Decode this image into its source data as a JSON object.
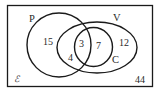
{
  "diagram": {
    "type": "venn",
    "universal_set": {
      "symbol": "ℰ",
      "outside_count": "44"
    },
    "sets": [
      {
        "name": "P",
        "label": "P"
      },
      {
        "name": "V",
        "label": "V"
      },
      {
        "name": "C",
        "label": "C"
      }
    ],
    "regions": {
      "p_only": "15",
      "p_and_v_not_c": "4",
      "p_and_v_and_c": "3",
      "v_and_c_not_p": "7",
      "v_only": "12"
    },
    "colors": {
      "stroke": "#1a1a1a",
      "text": "#2a2a2a",
      "background": "#ffffff"
    }
  }
}
